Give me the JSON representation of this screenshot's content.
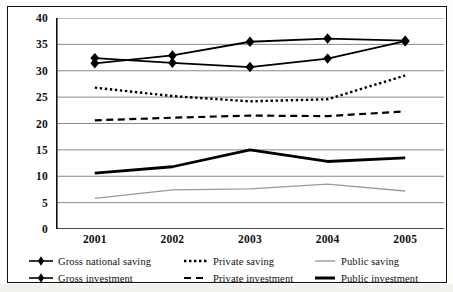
{
  "chart_data": {
    "type": "line",
    "title": "",
    "subtitle": "",
    "xlabel": "",
    "ylabel": "",
    "categories": [
      "2001",
      "2002",
      "2003",
      "2004",
      "2005"
    ],
    "ylim": [
      0,
      40
    ],
    "yticks": [
      0,
      5,
      10,
      15,
      20,
      25,
      30,
      35,
      40
    ],
    "grid": "horizontal",
    "legend_position": "bottom",
    "series": [
      {
        "name": "Gross national saving",
        "values": [
          32.4,
          31.5,
          30.7,
          32.3,
          35.6
        ],
        "style": "solid-marker",
        "marker": "diamond",
        "color": "#000000",
        "width": 1.8
      },
      {
        "name": "Gross investment",
        "values": [
          31.4,
          32.9,
          35.5,
          36.1,
          35.7
        ],
        "style": "solid-marker",
        "marker": "diamond",
        "color": "#000000",
        "width": 1.8
      },
      {
        "name": "Private saving",
        "values": [
          26.8,
          25.2,
          24.2,
          24.6,
          29.1
        ],
        "style": "dotted",
        "marker": "none",
        "color": "#000000",
        "width": 2.4
      },
      {
        "name": "Private investment",
        "values": [
          20.6,
          21.1,
          21.5,
          21.4,
          22.3
        ],
        "style": "dashed",
        "marker": "none",
        "color": "#000000",
        "width": 2.2
      },
      {
        "name": "Public saving",
        "values": [
          5.8,
          7.4,
          7.6,
          8.5,
          7.2
        ],
        "style": "solid-thin",
        "marker": "none",
        "color": "#9a9a9a",
        "width": 1.3
      },
      {
        "name": "Public investment",
        "values": [
          10.6,
          11.8,
          15.0,
          12.8,
          13.5
        ],
        "style": "solid-thick",
        "marker": "none",
        "color": "#000000",
        "width": 2.8
      }
    ]
  },
  "axes": {
    "y_tick_labels": [
      "40",
      "35",
      "30",
      "25",
      "20",
      "15",
      "10",
      "5",
      "0"
    ],
    "x_tick_labels": [
      "2001",
      "2002",
      "2003",
      "2004",
      "2005"
    ]
  },
  "legend": {
    "entries": [
      {
        "label": "Gross national saving",
        "key": "diamond-solid-line-key"
      },
      {
        "label": "Private saving",
        "key": "dotted-line-key"
      },
      {
        "label": "Public saving",
        "key": "thin-grey-line-key"
      },
      {
        "label": "Gross investment",
        "key": "diamond-solid-line-key"
      },
      {
        "label": "Private investment",
        "key": "dashed-line-key"
      },
      {
        "label": "Public investment",
        "key": "thick-black-line-key"
      }
    ]
  },
  "colors": {
    "frame": "#111111",
    "gridline": "#7a7a7a",
    "axis": "#111111",
    "series_black": "#000000",
    "series_grey": "#9a9a9a",
    "background": "#ffffff"
  }
}
